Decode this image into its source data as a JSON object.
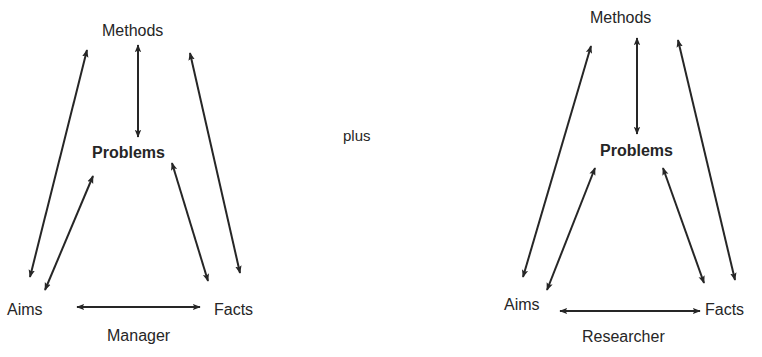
{
  "diagrams": [
    {
      "nodes": {
        "top": "Methods",
        "middle": "Problems",
        "left": "Aims",
        "right": "Facts"
      },
      "caption": "Manager"
    },
    {
      "nodes": {
        "top": "Methods",
        "middle": "Problems",
        "left": "Aims",
        "right": "Facts"
      },
      "caption": "Researcher"
    }
  ],
  "connector": "plus",
  "colors": {
    "ink": "#262626",
    "background": "#ffffff"
  }
}
